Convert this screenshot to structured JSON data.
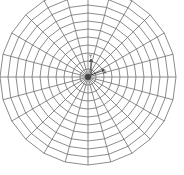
{
  "diagram": {
    "type": "polar-mesh",
    "center": [
      88,
      77
    ],
    "outer_radius": 88,
    "ring_count": 11,
    "spoke_count": 24,
    "line_color": "#6e6e6e",
    "background": "#ffffff",
    "axis_triad": {
      "y_label": "Y",
      "x_label": "X"
    }
  }
}
